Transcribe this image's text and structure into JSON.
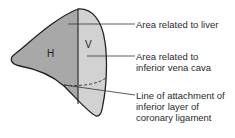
{
  "diagram": {
    "region_labels": {
      "hepatic": "H",
      "vena_cava": "V"
    },
    "callouts": [
      {
        "text_lines": [
          "Area related to liver"
        ]
      },
      {
        "text_lines": [
          "Area related to",
          "inferior vena cava"
        ]
      },
      {
        "text_lines": [
          "Line of attachment of",
          "inferior layer of",
          "coronary ligament"
        ]
      }
    ],
    "colors": {
      "hepatic_area": "#a8a8a8",
      "vena_cava_area": "#d2d2d2",
      "outline": "#222222"
    }
  }
}
